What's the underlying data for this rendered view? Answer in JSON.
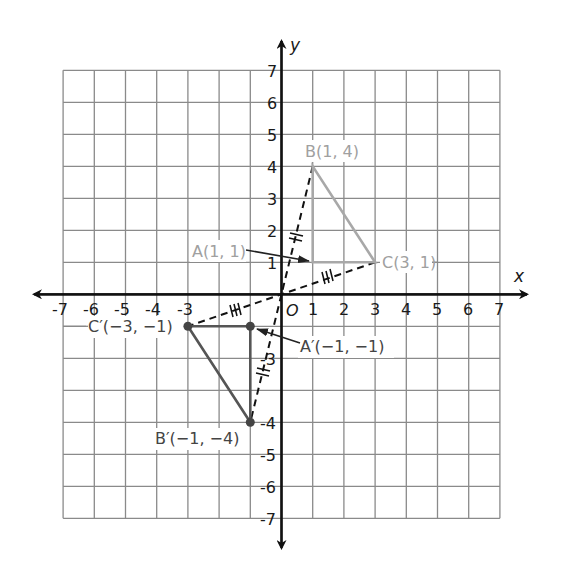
{
  "diagram": {
    "type": "coordinate-plane-reflection",
    "axes": {
      "x_label": "x",
      "y_label": "y",
      "origin_label": "O",
      "x_range": [
        -7,
        7
      ],
      "y_range": [
        -7,
        7
      ],
      "x_tick_labels": [
        {
          "value": -7,
          "text": "-7"
        },
        {
          "value": -6,
          "text": "-6"
        },
        {
          "value": -5,
          "text": "-5"
        },
        {
          "value": -4,
          "text": "-4"
        },
        {
          "value": -3,
          "text": "-3"
        },
        {
          "value": 1,
          "text": "1"
        },
        {
          "value": 2,
          "text": "2"
        },
        {
          "value": 3,
          "text": "3"
        },
        {
          "value": 4,
          "text": "4"
        },
        {
          "value": 5,
          "text": "5"
        },
        {
          "value": 6,
          "text": "6"
        },
        {
          "value": 7,
          "text": "7"
        }
      ],
      "y_tick_labels": [
        {
          "value": 7,
          "text": "7"
        },
        {
          "value": 6,
          "text": "6"
        },
        {
          "value": 5,
          "text": "5"
        },
        {
          "value": 4,
          "text": "4"
        },
        {
          "value": 3,
          "text": "3"
        },
        {
          "value": 2,
          "text": "2"
        },
        {
          "value": 1,
          "text": "1"
        },
        {
          "value": -3,
          "text": "-3"
        },
        {
          "value": -4,
          "text": "-4"
        },
        {
          "value": -5,
          "text": "-5"
        },
        {
          "value": -6,
          "text": "-6"
        },
        {
          "value": -7,
          "text": "-7"
        }
      ]
    },
    "original_triangle": {
      "color": "#a8a8a8",
      "vertices": [
        {
          "name": "A",
          "x": 1,
          "y": 1,
          "label": "A(1, 1)"
        },
        {
          "name": "B",
          "x": 1,
          "y": 4,
          "label": "B(1, 4)"
        },
        {
          "name": "C",
          "x": 3,
          "y": 1,
          "label": "C(3, 1)"
        }
      ]
    },
    "image_triangle": {
      "color": "#555555",
      "vertices": [
        {
          "name": "A'",
          "x": -1,
          "y": -1,
          "label": "A′(−1, −1)"
        },
        {
          "name": "B'",
          "x": -1,
          "y": -4,
          "label": "B′(−1, −4)"
        },
        {
          "name": "C'",
          "x": -3,
          "y": -1,
          "label": "C′(−3, −1)"
        }
      ]
    },
    "dashed_segments": [
      {
        "from": "B",
        "to": "B'",
        "through": "O",
        "tick_marks": 2
      },
      {
        "from": "C",
        "to": "C'",
        "through": "O",
        "tick_marks": 3
      }
    ]
  }
}
